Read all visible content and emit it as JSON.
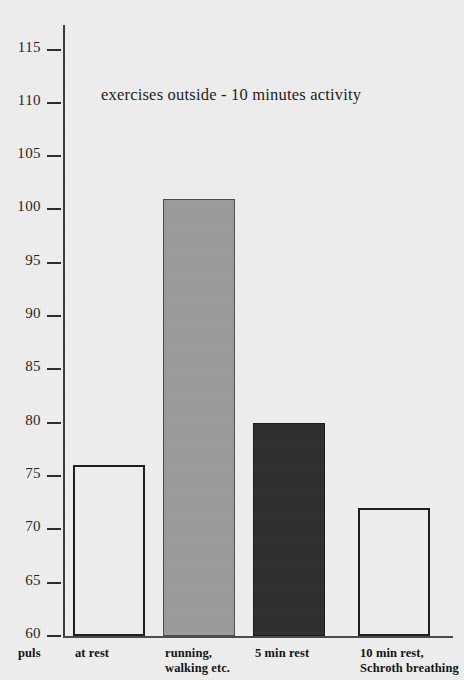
{
  "chart_data": {
    "type": "bar",
    "title": "exercises outside - 10 minutes activity",
    "xlabel": "puls",
    "ylabel": "",
    "ylim": [
      60,
      115
    ],
    "ytick_step": 5,
    "yticks": [
      60,
      65,
      70,
      75,
      80,
      85,
      90,
      95,
      100,
      105,
      110,
      115
    ],
    "ytick_labels": [
      "60",
      "65",
      "70",
      "75",
      "80",
      "85",
      "90",
      "95",
      "100",
      "105",
      "110",
      "115"
    ],
    "grid": false,
    "legend": "none",
    "categories": [
      "at rest",
      "running,\nwalking etc.",
      "5 min rest",
      "10 min rest,\nSchroth breathing"
    ],
    "values": [
      76,
      101,
      80,
      72
    ],
    "bar_styles": [
      "outline",
      "gray",
      "dark",
      "outline"
    ],
    "colors": {
      "background": "#eeeeee",
      "axis": "#2b2b2b",
      "bar_outline_fill": "#eeeeee",
      "bar_outline_stroke": "#1c1c1c",
      "bar_gray_fill": "#9a9a9a",
      "bar_dark_fill": "#2e2e2e",
      "text": "#111111"
    }
  },
  "axis": {
    "unit_label": "puls"
  }
}
